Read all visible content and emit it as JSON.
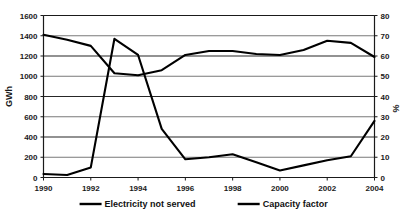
{
  "chart_data": {
    "type": "line",
    "title": "",
    "subtitle": "",
    "xlabel": "",
    "ylabel": "GWh",
    "y2label": "%",
    "x": [
      1990,
      1991,
      1992,
      1993,
      1994,
      1995,
      1996,
      1997,
      1998,
      1999,
      2000,
      2001,
      2002,
      2003,
      2004
    ],
    "xlim": [
      1990,
      2004
    ],
    "xtick_labels": [
      "1990",
      "1992",
      "1994",
      "1996",
      "1998",
      "2000",
      "2002",
      "2004"
    ],
    "xticks": [
      1990,
      1992,
      1994,
      1996,
      1998,
      2000,
      2002,
      2004
    ],
    "ylim": [
      0,
      1600
    ],
    "yticks": [
      0,
      200,
      400,
      600,
      800,
      1000,
      1200,
      1400,
      1600
    ],
    "ytick_labels": [
      "0",
      "200",
      "400",
      "600",
      "800",
      "1000",
      "1200",
      "1400",
      "1600"
    ],
    "y2lim": [
      0,
      80
    ],
    "y2ticks": [
      0,
      10,
      20,
      30,
      40,
      50,
      60,
      70,
      80
    ],
    "y2tick_labels": [
      "0",
      "10",
      "20",
      "30",
      "40",
      "50",
      "60",
      "70",
      "80"
    ],
    "grid": true,
    "legend_position": "bottom",
    "series": [
      {
        "name": "Electricity not served",
        "axis": "left",
        "units": "GWh",
        "color": "#000000",
        "values": [
          35,
          25,
          100,
          1370,
          1210,
          480,
          180,
          200,
          230,
          150,
          70,
          120,
          170,
          210,
          560
        ]
      },
      {
        "name": "Capacity factor",
        "axis": "right",
        "units": "%",
        "color": "#000000",
        "values": [
          70.5,
          68.0,
          65.0,
          51.5,
          50.5,
          53.0,
          60.5,
          62.5,
          62.5,
          61.0,
          60.5,
          63.0,
          67.5,
          66.5,
          59.5
        ]
      }
    ],
    "legend": [
      {
        "label": "Electricity not served",
        "color": "#000000"
      },
      {
        "label": "Capacity factor",
        "color": "#000000"
      }
    ]
  }
}
